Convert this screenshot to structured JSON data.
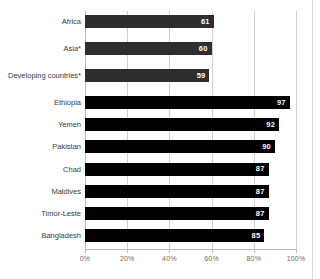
{
  "chart_data": {
    "type": "bar",
    "orientation": "horizontal",
    "title": "",
    "subtitle": "",
    "xlabel": "",
    "ylabel": "",
    "xlim": [
      0,
      100
    ],
    "x_unit": "%",
    "grid": true,
    "legend": "none",
    "x_ticks": [
      "0%",
      "20%",
      "40%",
      "60%",
      "80%",
      "100%"
    ],
    "x_tick_values": [
      0,
      20,
      40,
      60,
      80,
      100
    ],
    "groups": [
      {
        "name": "regions-and-aggregates",
        "bar_color": "#2e2e2e",
        "categories": [
          "Africa",
          "Asia*",
          "Developing countries*"
        ],
        "values": [
          61,
          60,
          59
        ]
      },
      {
        "name": "countries",
        "bar_color": "#000000",
        "categories": [
          "Ethiopia",
          "Yemen",
          "Pakistan",
          "Chad",
          "Maldives",
          "Timor-Leste",
          "Bangladesh"
        ],
        "values": [
          97,
          92,
          90,
          87,
          87,
          87,
          85
        ]
      }
    ],
    "categories": [
      "Africa",
      "Asia*",
      "Developing countries*",
      "Ethiopia",
      "Yemen",
      "Pakistan",
      "Chad",
      "Maldives",
      "Timor-Leste",
      "Bangladesh"
    ],
    "values": [
      61,
      60,
      59,
      97,
      92,
      90,
      87,
      87,
      87,
      85
    ],
    "data_labels": [
      "61",
      "60",
      "59",
      "97",
      "92",
      "90",
      "87",
      "87",
      "87",
      "85"
    ]
  },
  "colors": {
    "bar_region": "#2e2e2e",
    "bar_country": "#000000",
    "gridline": "#cfcfcf",
    "axis": "#bdbdbd",
    "category_label": "#3a3a3a",
    "tick_label": "#6b6b6b",
    "value_label": "#ffffff",
    "background": "#ffffff"
  }
}
